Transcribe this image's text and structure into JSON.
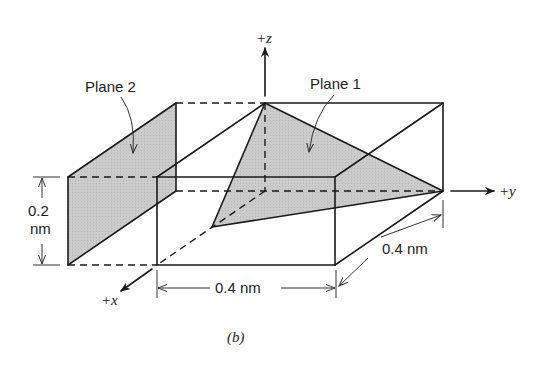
{
  "figure": {
    "caption": "(b)",
    "plane_fill_color": "#c9c9c9",
    "line_color": "#1a1a1a"
  },
  "axes": {
    "x_label": "+x",
    "y_label": "+y",
    "z_label": "+z"
  },
  "planes": [
    {
      "name": "plane-1",
      "label": "Plane 1"
    },
    {
      "name": "plane-2",
      "label": "Plane 2"
    }
  ],
  "dimensions": {
    "height_value": "0.2",
    "height_unit": "nm",
    "width_label": "0.4 nm",
    "depth_label": "0.4 nm"
  }
}
